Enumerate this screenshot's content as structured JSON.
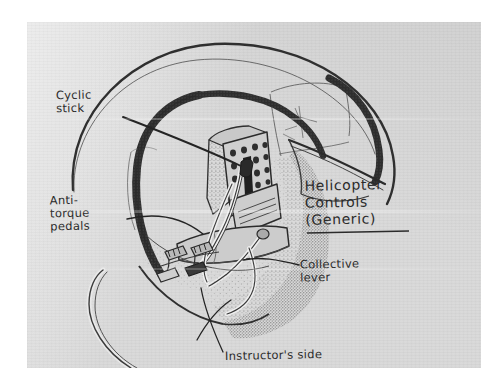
{
  "figure": {
    "medium": "hand-drawn pencil and ink sketch on gray paper",
    "title": {
      "line1": "Helicopter",
      "line2": "Controls",
      "line3": "(Generic)"
    },
    "labels": [
      {
        "id": "cyclic-stick",
        "line1": "Cyclic",
        "line2": "stick",
        "line3": ""
      },
      {
        "id": "anti-torque-pedals",
        "line1": "Anti-",
        "line2": "torque",
        "line3": "pedals"
      },
      {
        "id": "collective-lever",
        "line1": "Collective",
        "line2": "lever",
        "line3": ""
      },
      {
        "id": "instructors-side",
        "line1": "Instructor's side",
        "line2": "",
        "line3": ""
      }
    ],
    "colors": {
      "paper": "#d8d8d8",
      "ink": "#2b2b2b",
      "frame_dark": "#3a3a3a",
      "shade_mid": "#8a8a8a",
      "page_surround": "#ffffff"
    }
  }
}
